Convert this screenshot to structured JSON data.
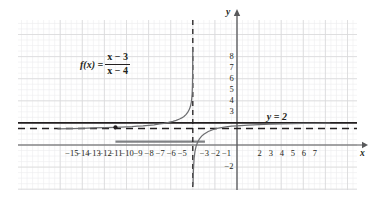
{
  "chart_data": {
    "type": "line",
    "title": "",
    "xlabel": "x",
    "ylabel": "y",
    "xlim": [
      -16.2,
      8.6
    ],
    "ylim": [
      -3.6,
      9.2
    ],
    "grid": true,
    "legend": false,
    "function_label": {
      "lhs": "f(x) =",
      "numerator": "x − 3",
      "denominator": "x − 4",
      "numerator_var": "x",
      "numerator_op": "−",
      "numerator_const": "3",
      "denominator_var": "x",
      "denominator_op": "−",
      "denominator_const": "4"
    },
    "annotations": [
      {
        "name": "horizontal-line-label",
        "text": "y = 2",
        "x": 3.6,
        "y": 2.45
      }
    ],
    "series": [
      {
        "name": "f(x) = (x-3)/(x-4)",
        "color": "#6d6e71",
        "style": "solid",
        "left_branch_points": [
          [
            -16.2,
            1.46
          ],
          [
            -15,
            1.49
          ],
          [
            -14,
            1.51
          ],
          [
            -13,
            1.54
          ],
          [
            -12,
            1.57
          ],
          [
            -11,
            1.6
          ],
          [
            -10,
            1.64
          ],
          [
            -9.5,
            1.66
          ],
          [
            -9,
            1.7
          ],
          [
            -8.5,
            1.73
          ],
          [
            -8,
            1.78
          ],
          [
            -7.5,
            1.83
          ],
          [
            -7,
            1.9
          ],
          [
            -6.6,
            1.96
          ],
          [
            -6.2,
            2.04
          ],
          [
            -5.8,
            2.14
          ],
          [
            -5.5,
            2.23
          ],
          [
            -5.2,
            2.35
          ],
          [
            -5.0,
            2.45
          ],
          [
            -4.8,
            2.58
          ],
          [
            -4.6,
            2.77
          ],
          [
            -4.45,
            2.97
          ],
          [
            -4.3,
            3.25
          ],
          [
            -4.2,
            3.55
          ],
          [
            -4.12,
            3.95
          ],
          [
            -4.06,
            4.6
          ],
          [
            -4.03,
            5.4
          ],
          [
            -4.015,
            6.4
          ],
          [
            -4.008,
            7.6
          ],
          [
            -4.004,
            8.8
          ]
        ],
        "right_branch_points": [
          [
            -3.98,
            -3.6
          ],
          [
            -3.96,
            -2.8
          ],
          [
            -3.93,
            -2.0
          ],
          [
            -3.88,
            -1.2
          ],
          [
            -3.8,
            -0.55
          ],
          [
            -3.7,
            -0.1
          ],
          [
            -3.55,
            0.3
          ],
          [
            -3.4,
            0.55
          ],
          [
            -3.2,
            0.8
          ],
          [
            -3.0,
            0.98
          ],
          [
            -2.6,
            1.22
          ],
          [
            -2.2,
            1.38
          ],
          [
            -1.8,
            1.5
          ],
          [
            -1.4,
            1.58
          ],
          [
            -1.0,
            1.64
          ],
          [
            -0.5,
            1.7
          ],
          [
            0,
            1.74
          ],
          [
            1,
            1.8
          ],
          [
            2,
            1.85
          ],
          [
            3,
            1.88
          ],
          [
            4,
            1.91
          ],
          [
            5,
            1.93
          ],
          [
            6,
            1.95
          ],
          [
            7,
            1.96
          ],
          [
            8.4,
            1.98
          ]
        ]
      },
      {
        "name": "vertical asymptote",
        "style": "dashed",
        "color": "#231f20",
        "x": -4
      },
      {
        "name": "horizontal asymptote",
        "style": "dashed",
        "color": "#231f20",
        "y": 1.5
      },
      {
        "name": "y = 2 line",
        "style": "solid",
        "color": "#231f20",
        "y": 2
      },
      {
        "name": "gray segment",
        "style": "solid-thick",
        "color": "#808285",
        "y": 0.3,
        "x_from": -11.0,
        "x_to": -2.9
      }
    ],
    "points": [
      {
        "name": "marked-point",
        "x": -11,
        "y": 1.6,
        "color": "#231f20"
      }
    ],
    "x_ticks": [
      {
        "value": -15,
        "label": "−15"
      },
      {
        "value": -14,
        "label": "−14"
      },
      {
        "value": -13,
        "label": "−13"
      },
      {
        "value": -12,
        "label": "−12"
      },
      {
        "value": -11,
        "label": "−11"
      },
      {
        "value": -10,
        "label": "−10"
      },
      {
        "value": -9,
        "label": "−9"
      },
      {
        "value": -8,
        "label": "−8"
      },
      {
        "value": -7,
        "label": "−7"
      },
      {
        "value": -6,
        "label": "−6"
      },
      {
        "value": -5,
        "label": "−5"
      },
      {
        "value": -3,
        "label": "−3"
      },
      {
        "value": -2,
        "label": "−2"
      },
      {
        "value": -1,
        "label": "−1"
      },
      {
        "value": 2,
        "label": "2"
      },
      {
        "value": 3,
        "label": "3"
      },
      {
        "value": 4,
        "label": "4"
      },
      {
        "value": 5,
        "label": "5"
      },
      {
        "value": 6,
        "label": "6"
      },
      {
        "value": 7,
        "label": "7"
      }
    ],
    "y_ticks": [
      {
        "value": 8,
        "label": "8"
      },
      {
        "value": 7,
        "label": "7"
      },
      {
        "value": 6,
        "label": "6"
      },
      {
        "value": 5,
        "label": "5"
      },
      {
        "value": 4,
        "label": "4"
      },
      {
        "value": 3,
        "label": "3"
      },
      {
        "value": -2,
        "label": "−2"
      }
    ],
    "axis_names": {
      "x": "x",
      "y": "y"
    }
  },
  "colors": {
    "curve": "#6d6e71",
    "axis": "#58595b",
    "grid_major": "#d9d9da",
    "grid_minor": "#ededee",
    "ink": "#231f20",
    "gray_segment": "#808285"
  }
}
